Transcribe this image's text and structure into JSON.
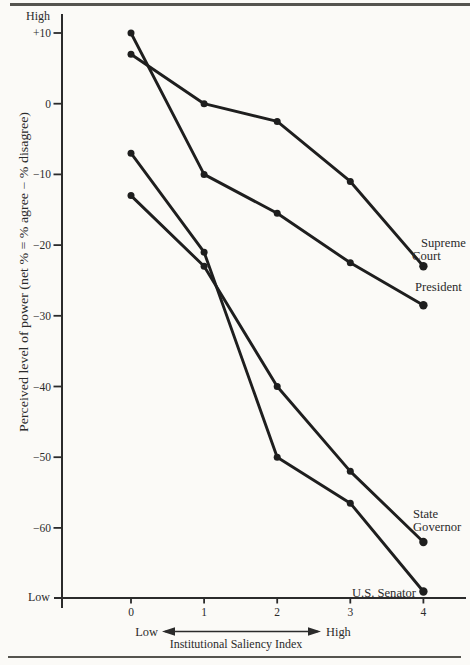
{
  "page": {
    "background": "#fbfaf7",
    "rule_color": "#555550",
    "axis_color": "#2b2b2b",
    "text_color": "#2b2b2b"
  },
  "chart_data": {
    "type": "line",
    "title": "",
    "xlabel": "Institutional Saliency Index",
    "x_arrow_low": "Low",
    "x_arrow_high": "High",
    "ylabel": "Perceived level of power (net % = % agree − % disagree)",
    "y_axis_top_label": "High",
    "y_axis_bottom_label": "Low",
    "x_categories": [
      "0",
      "1",
      "2",
      "3",
      "4"
    ],
    "y_ticks": [
      10,
      0,
      -10,
      -20,
      -30,
      -40,
      -50,
      -60
    ],
    "y_tick_labels": [
      "+10",
      "0",
      "−10",
      "−20",
      "−30",
      "−40",
      "−50",
      "−60"
    ],
    "ylim": [
      -71,
      13
    ],
    "grid": false,
    "legend_position": "right-annotations",
    "line_color": "#1e1e1e",
    "series": [
      {
        "name": "Supreme Court",
        "label_lines": [
          "Supreme",
          "Court"
        ],
        "values": [
          7,
          0,
          -2.5,
          -11,
          -23
        ]
      },
      {
        "name": "President",
        "label_lines": [
          "President"
        ],
        "values": [
          10,
          -10,
          -15.5,
          -22.5,
          -28.5
        ]
      },
      {
        "name": "State Governor",
        "label_lines": [
          "State",
          "Governor"
        ],
        "values": [
          -13,
          -23,
          -40,
          -52,
          -62
        ]
      },
      {
        "name": "U.S. Senator",
        "label_lines": [
          "U.S. Senator"
        ],
        "values": [
          -7,
          -21,
          -50,
          -56.5,
          -69
        ]
      }
    ]
  }
}
